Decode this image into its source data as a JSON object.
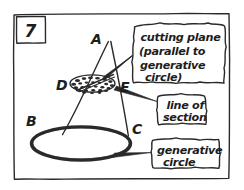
{
  "figure": {
    "number": "7",
    "ink_color": "#2a2a2a",
    "background_color": "#ffffff"
  },
  "vertex_labels": [
    {
      "id": "apex",
      "label": "A"
    },
    {
      "id": "base-left",
      "label": "B"
    },
    {
      "id": "base-right",
      "label": "C"
    },
    {
      "id": "section-left",
      "label": "D"
    },
    {
      "id": "section-right",
      "label": "E"
    }
  ],
  "callouts": [
    {
      "id": "cutting-plane",
      "lines": [
        "cutting plane",
        "(parallel to",
        "generative",
        "circle)"
      ]
    },
    {
      "id": "line-of-section",
      "lines": [
        "line of",
        "section"
      ]
    },
    {
      "id": "generative-circle",
      "lines": [
        "generative",
        "circle"
      ]
    }
  ]
}
